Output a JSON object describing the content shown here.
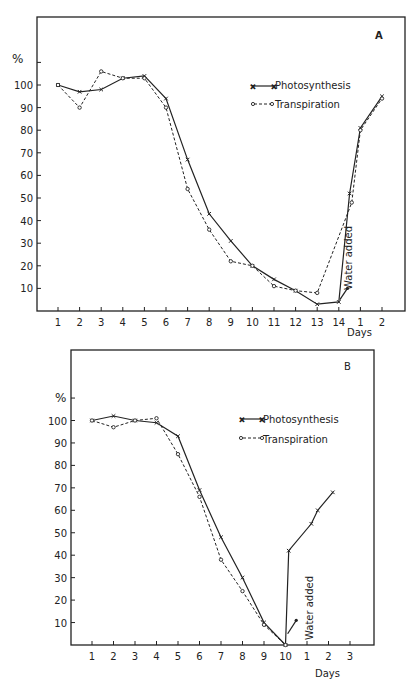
{
  "chart_data": [
    {
      "panel": "A",
      "type": "line",
      "title": "A",
      "ylabel": "%",
      "xlabel": "Days",
      "ylim": [
        0,
        110
      ],
      "grid": false,
      "legend_position": "upper-right inside",
      "y_ticks": [
        10,
        20,
        30,
        40,
        50,
        60,
        70,
        80,
        90,
        100
      ],
      "categories": [
        "1",
        "2",
        "3",
        "4",
        "5",
        "6",
        "7",
        "8",
        "9",
        "10",
        "11",
        "12",
        "13",
        "14",
        "1",
        "2"
      ],
      "series": [
        {
          "name": "Photosynthesis",
          "style": "solid, x markers",
          "x": [
            0,
            1,
            2,
            3,
            4,
            5,
            6,
            7,
            8,
            9,
            10,
            11,
            12,
            13,
            13.5,
            14,
            15
          ],
          "values": [
            100,
            97,
            98,
            103,
            104,
            94,
            67,
            43,
            31,
            20,
            14,
            9,
            3,
            4,
            52,
            81,
            95
          ]
        },
        {
          "name": "Transpiration",
          "style": "dashed, open circle markers",
          "x": [
            0,
            1,
            2,
            3,
            4,
            5,
            6,
            7,
            8,
            9,
            10,
            11,
            12,
            13,
            13.6,
            14,
            15
          ],
          "values": [
            100,
            90,
            106,
            103,
            103,
            90,
            54,
            36,
            22,
            20,
            11,
            9,
            8,
            null,
            48,
            80,
            94
          ]
        }
      ],
      "annotations": [
        {
          "text": "Water added",
          "at_day_index": 13.5,
          "arrow_value": 10
        }
      ]
    },
    {
      "panel": "B",
      "type": "line",
      "title": "B",
      "ylabel": "%",
      "xlabel": "Days",
      "ylim": [
        0,
        110
      ],
      "grid": false,
      "legend_position": "upper-right inside",
      "y_ticks": [
        10,
        20,
        30,
        40,
        50,
        60,
        70,
        80,
        90,
        100
      ],
      "categories": [
        "1",
        "2",
        "3",
        "4",
        "5",
        "6",
        "7",
        "8",
        "9",
        "10",
        "1",
        "2",
        "3"
      ],
      "series": [
        {
          "name": "Photosynthesis",
          "style": "solid, x markers",
          "x": [
            0,
            1,
            2,
            3,
            4,
            5,
            6,
            7,
            8,
            9,
            9.15,
            10.2,
            10.5,
            11.2
          ],
          "values": [
            100,
            102,
            100,
            99,
            93,
            69,
            48,
            30,
            10,
            0,
            42,
            54,
            60,
            68
          ]
        },
        {
          "name": "Transpiration",
          "style": "dashed, open circle markers",
          "x": [
            0,
            1,
            2,
            3,
            4,
            5,
            6,
            7,
            8,
            9
          ],
          "values": [
            100,
            97,
            100,
            101,
            85,
            66,
            38,
            24,
            9,
            0
          ]
        }
      ],
      "annotations": [
        {
          "text": "Water added",
          "at_day_index": 9.7,
          "arrow_value": 11
        }
      ]
    }
  ],
  "labels": {
    "percent": "%",
    "days": "Days",
    "water_added": "Water added",
    "legend_photosynthesis": "Photosynthesis",
    "legend_transpiration": "Transpiration",
    "panel_a": "A",
    "panel_b": "B"
  }
}
